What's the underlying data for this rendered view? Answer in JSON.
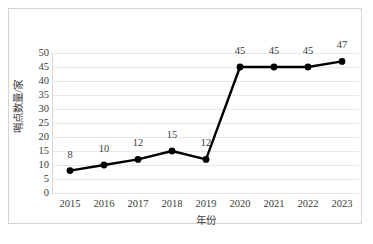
{
  "chart_data": {
    "type": "line",
    "title": "",
    "xlabel": "年份",
    "ylabel": "哨点数量/家",
    "categories": [
      "2015",
      "2016",
      "2017",
      "2018",
      "2019",
      "2020",
      "2021",
      "2022",
      "2023"
    ],
    "values": [
      8,
      10,
      12,
      15,
      12,
      45,
      45,
      45,
      47
    ],
    "data_labels": [
      "8",
      "10",
      "12",
      "15",
      "12",
      "45",
      "45",
      "45",
      "47"
    ],
    "ylim": [
      0,
      50
    ],
    "yticks": [
      0,
      5,
      10,
      15,
      20,
      25,
      30,
      35,
      40,
      45,
      50
    ],
    "ytick_labels": [
      "0",
      "5",
      "10",
      "15",
      "20",
      "25",
      "30",
      "35",
      "40",
      "45",
      "50"
    ],
    "grid": "horizontal",
    "legend": "none",
    "series_color": "#000000",
    "marker": "circle",
    "gridline_color": "#e8e8e8",
    "text_color": "#3b3b3b",
    "background": "#ffffff",
    "border_color": "#d4d4d4"
  }
}
